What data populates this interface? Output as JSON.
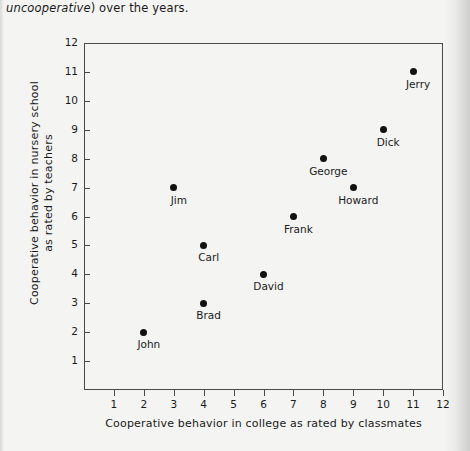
{
  "body_text": {
    "italic_part": "uncooperative",
    "roman_part": ") over the years."
  },
  "chart_data": {
    "type": "scatter",
    "title": "",
    "xlabel_line1": "Cooperative behavior in college",
    "xlabel_line2": "as rated by classmates",
    "ylabel_line1": "Cooperative behavior in nursery school",
    "ylabel_line2": "as rated by teachers",
    "xlim": [
      0,
      12
    ],
    "ylim": [
      0,
      12
    ],
    "xticks": [
      1,
      2,
      3,
      4,
      5,
      6,
      7,
      8,
      9,
      10,
      11,
      12
    ],
    "yticks": [
      1,
      2,
      3,
      4,
      5,
      6,
      7,
      8,
      9,
      10,
      11,
      12
    ],
    "grid": false,
    "legend": null,
    "marker_color": "#111111",
    "axis_color": "#4a4a4a",
    "points": [
      {
        "label": "John",
        "x": 2,
        "y": 2
      },
      {
        "label": "Brad",
        "x": 4,
        "y": 3
      },
      {
        "label": "David",
        "x": 6,
        "y": 4
      },
      {
        "label": "Carl",
        "x": 4,
        "y": 5
      },
      {
        "label": "Frank",
        "x": 7,
        "y": 6
      },
      {
        "label": "Jim",
        "x": 3,
        "y": 7
      },
      {
        "label": "Howard",
        "x": 9,
        "y": 7
      },
      {
        "label": "George",
        "x": 8,
        "y": 8
      },
      {
        "label": "Dick",
        "x": 10,
        "y": 9
      },
      {
        "label": "Jerry",
        "x": 11,
        "y": 11
      }
    ]
  }
}
